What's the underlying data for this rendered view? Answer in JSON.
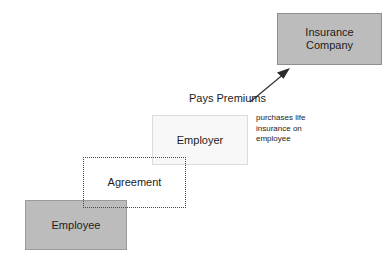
{
  "diagram": {
    "background_color": "#ffffff",
    "nodes": [
      {
        "id": "insurance-company",
        "label": "Insurance\nCompany",
        "fill_color": "#bcbcbc",
        "border_color": "#8f8f8f",
        "border_style": "solid"
      },
      {
        "id": "employer",
        "label": "Employer",
        "fill_color": "#f8f8f8",
        "border_color": "#dcdcdc",
        "border_style": "solid"
      },
      {
        "id": "agreement",
        "label": "Agreement",
        "fill_color": "transparent",
        "border_color": "#4a4a4a",
        "border_style": "dotted"
      },
      {
        "id": "employee",
        "label": "Employee",
        "fill_color": "#bcbcbc",
        "border_color": "#9a9a9a",
        "border_style": "solid"
      }
    ],
    "edges": [
      {
        "id": "pays-premiums",
        "label": "Pays Premiums",
        "from": "employer",
        "to": "insurance-company",
        "color": "#2b2b2b",
        "arrowhead": "filled-triangle"
      }
    ],
    "annotations": [
      {
        "id": "purchases-note",
        "text": "purchases life\ninsurance on\nemployee",
        "color": "#2b2b2b"
      }
    ]
  }
}
